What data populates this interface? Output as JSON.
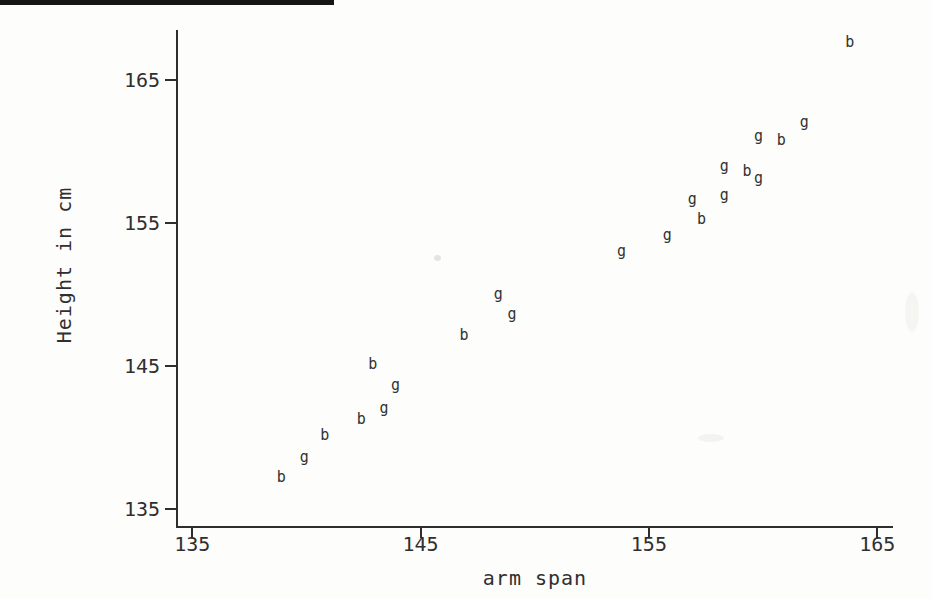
{
  "chart_data": {
    "type": "scatter",
    "title": "",
    "xlabel": "arm span",
    "ylabel": "Height in cm",
    "xlim": [
      133.3,
      165.7
    ],
    "ylim": [
      133.7,
      168.6
    ],
    "x_ticks": [
      135,
      145,
      155,
      165
    ],
    "y_ticks": [
      135,
      145,
      155,
      165
    ],
    "grid": false,
    "legend": "none",
    "marker_style": "letter-glyph",
    "ink_color": "#2e2e2e",
    "paper_color": "#fdfdfb",
    "series": [
      {
        "name": "b",
        "marker": "b",
        "points": [
          {
            "x": 138.9,
            "y": 137.2
          },
          {
            "x": 140.8,
            "y": 140.1
          },
          {
            "x": 142.4,
            "y": 141.2
          },
          {
            "x": 142.9,
            "y": 145.1
          },
          {
            "x": 146.9,
            "y": 147.1
          },
          {
            "x": 157.3,
            "y": 155.2
          },
          {
            "x": 159.3,
            "y": 158.6
          },
          {
            "x": 160.8,
            "y": 160.7
          },
          {
            "x": 163.8,
            "y": 167.6
          }
        ]
      },
      {
        "name": "g",
        "marker": "g",
        "points": [
          {
            "x": 139.9,
            "y": 138.6
          },
          {
            "x": 143.4,
            "y": 142.0
          },
          {
            "x": 143.9,
            "y": 143.6
          },
          {
            "x": 148.4,
            "y": 150.0
          },
          {
            "x": 149.0,
            "y": 148.6
          },
          {
            "x": 153.8,
            "y": 153.0
          },
          {
            "x": 155.8,
            "y": 154.1
          },
          {
            "x": 156.9,
            "y": 156.6
          },
          {
            "x": 158.3,
            "y": 158.9
          },
          {
            "x": 158.3,
            "y": 156.9
          },
          {
            "x": 159.8,
            "y": 158.1
          },
          {
            "x": 159.8,
            "y": 161.0
          },
          {
            "x": 161.8,
            "y": 162.0
          }
        ]
      }
    ]
  }
}
